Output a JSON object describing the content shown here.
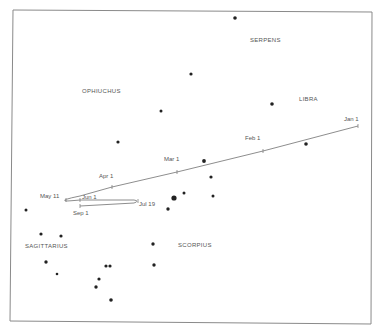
{
  "chart_data": {
    "type": "diagram",
    "title": "",
    "frame": {
      "x1": 13,
      "y1": 10,
      "x2": 372,
      "y2": 323
    },
    "constellations": [
      {
        "name": "SERPENS",
        "x": 250,
        "y": 42
      },
      {
        "name": "OPHIUCHUS",
        "x": 82,
        "y": 93
      },
      {
        "name": "LIBRA",
        "x": 299,
        "y": 101
      },
      {
        "name": "SAGITTARIUS",
        "x": 25,
        "y": 248
      },
      {
        "name": "SCORPIUS",
        "x": 178,
        "y": 247
      }
    ],
    "stars": [
      {
        "x": 235,
        "y": 18,
        "r": 1.8
      },
      {
        "x": 191,
        "y": 74,
        "r": 1.6
      },
      {
        "x": 161,
        "y": 111,
        "r": 1.5
      },
      {
        "x": 272,
        "y": 104,
        "r": 1.8
      },
      {
        "x": 118,
        "y": 142,
        "r": 1.6
      },
      {
        "x": 306,
        "y": 144,
        "r": 1.8
      },
      {
        "x": 204,
        "y": 161,
        "r": 1.9
      },
      {
        "x": 211,
        "y": 177,
        "r": 1.6
      },
      {
        "x": 174,
        "y": 198,
        "r": 2.6
      },
      {
        "x": 184,
        "y": 193,
        "r": 1.5
      },
      {
        "x": 213,
        "y": 196,
        "r": 1.5
      },
      {
        "x": 168,
        "y": 209,
        "r": 1.7
      },
      {
        "x": 26,
        "y": 210,
        "r": 1.5
      },
      {
        "x": 41,
        "y": 234,
        "r": 1.6
      },
      {
        "x": 61,
        "y": 236,
        "r": 1.6
      },
      {
        "x": 153,
        "y": 244,
        "r": 1.7
      },
      {
        "x": 46,
        "y": 262,
        "r": 1.7
      },
      {
        "x": 57,
        "y": 274,
        "r": 1.3
      },
      {
        "x": 106,
        "y": 266,
        "r": 1.6
      },
      {
        "x": 110,
        "y": 266,
        "r": 1.6
      },
      {
        "x": 154,
        "y": 265,
        "r": 1.7
      },
      {
        "x": 99,
        "y": 279,
        "r": 1.6
      },
      {
        "x": 96,
        "y": 287,
        "r": 1.7
      },
      {
        "x": 111,
        "y": 300,
        "r": 1.8
      }
    ],
    "path_points": [
      {
        "x": 358,
        "y": 126
      },
      {
        "x": 263,
        "y": 151
      },
      {
        "x": 177,
        "y": 172
      },
      {
        "x": 112,
        "y": 187
      },
      {
        "x": 80,
        "y": 196
      },
      {
        "x": 66,
        "y": 200
      },
      {
        "x": 80,
        "y": 200
      },
      {
        "x": 138,
        "y": 201
      },
      {
        "x": 80,
        "y": 206
      }
    ],
    "date_marks": [
      {
        "label": "Jan 1",
        "x": 344,
        "y": 121,
        "tick_x": 358,
        "tick_y": 126
      },
      {
        "label": "Feb 1",
        "x": 245,
        "y": 140,
        "tick_x": 263,
        "tick_y": 151
      },
      {
        "label": "Mar 1",
        "x": 164,
        "y": 161,
        "tick_x": 177,
        "tick_y": 172
      },
      {
        "label": "Apr 1",
        "x": 99,
        "y": 178,
        "tick_x": 112,
        "tick_y": 187
      },
      {
        "label": "May 11",
        "x": 40,
        "y": 198,
        "tick_x": 66,
        "tick_y": 200
      },
      {
        "label": "Jun 1",
        "x": 82,
        "y": 199,
        "tick_x": 80,
        "tick_y": 200
      },
      {
        "label": "Jul 19",
        "x": 139,
        "y": 206,
        "tick_x": 138,
        "tick_y": 201
      },
      {
        "label": "Sep 1",
        "x": 73,
        "y": 215,
        "tick_x": 80,
        "tick_y": 206
      }
    ]
  }
}
